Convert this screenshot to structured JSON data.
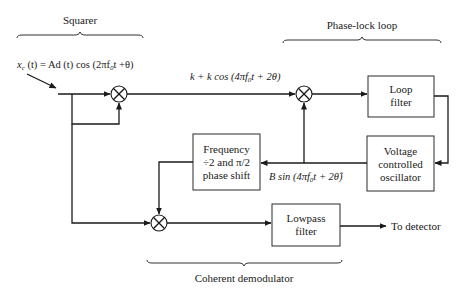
{
  "sections": {
    "squarer": "Squarer",
    "pll": "Phase-lock loop",
    "demod": "Coherent demodulator"
  },
  "signals": {
    "input": {
      "x": "x",
      "sub": "c",
      "rest": " (t) = Ad (t) cos (2πf",
      "sub0": "0",
      "tail": "t +θ)"
    },
    "squared": {
      "head": "k + k cos (4πf",
      "sub0": "0",
      "tail": "t + 2θ)"
    },
    "vco_out": {
      "head": "B sin (4πf",
      "sub0": "0",
      "tail": "t + 2θ̂)"
    },
    "output": "To detector"
  },
  "blocks": {
    "loop_filter": [
      "Loop",
      "filter"
    ],
    "vco": [
      "Voltage",
      "controlled",
      "oscillator"
    ],
    "freq_div": [
      "Frequency",
      "÷2 and π/2",
      "phase shift"
    ],
    "lowpass": [
      "Lowpass",
      "filter"
    ]
  },
  "icons": {
    "multiplier": "circle-x-multiplier-icon"
  }
}
